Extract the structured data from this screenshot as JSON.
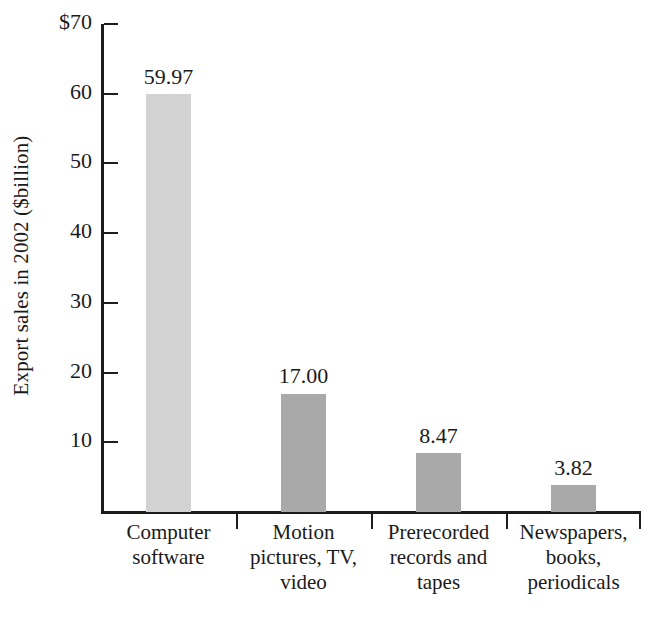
{
  "chart_data": {
    "type": "bar",
    "title": "",
    "xlabel": "",
    "ylabel": "Export sales in 2002 ($billion)",
    "categories": [
      "Computer software",
      "Motion pictures, TV, video",
      "Prerecorded records and tapes",
      "Newspapers, books, periodicals"
    ],
    "category_lines": [
      [
        "Computer",
        "software"
      ],
      [
        "Motion",
        "pictures, TV,",
        "video"
      ],
      [
        "Prerecorded",
        "records and",
        "tapes"
      ],
      [
        "Newspapers,",
        "books,",
        "periodicals"
      ]
    ],
    "values": [
      59.97,
      17.0,
      8.47,
      3.82
    ],
    "value_labels": [
      "59.97",
      "17.00",
      "8.47",
      "3.82"
    ],
    "bar_colors": [
      "#d2d2d2",
      "#a9a9a9",
      "#a9a9a9",
      "#a9a9a9"
    ],
    "ylim": [
      0,
      70
    ],
    "ytick_values": [
      70,
      60,
      50,
      40,
      30,
      20,
      10
    ],
    "ytick_labels": [
      "$70",
      "60",
      "50",
      "40",
      "30",
      "20",
      "10"
    ],
    "grid": false,
    "legend": "none",
    "axis_color": "#1c1c1c"
  }
}
